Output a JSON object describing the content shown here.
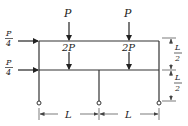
{
  "diagram": {
    "type": "two-story frame with pinned column bases",
    "loads": {
      "top_vertical_left": "P",
      "top_vertical_right": "P",
      "mid_vertical_left": "2P",
      "mid_vertical_right": "2P",
      "horizontal_top_num": "P",
      "horizontal_top_den": "4",
      "horizontal_mid_num": "P",
      "horizontal_mid_den": "4"
    },
    "dimensions": {
      "span_left": "L",
      "span_right": "L",
      "story_upper_num": "L",
      "story_upper_den": "2",
      "story_lower_num": "L",
      "story_lower_den": "2"
    },
    "colors": {
      "line": "#333333",
      "text": "#222222",
      "background": "#ffffff"
    }
  }
}
